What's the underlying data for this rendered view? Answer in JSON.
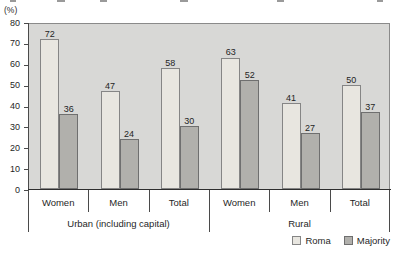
{
  "chart_data": {
    "type": "bar",
    "title": "",
    "ylabel": "(%)",
    "xlabel": "",
    "categories": [
      "Women",
      "Men",
      "Total",
      "Women",
      "Men",
      "Total"
    ],
    "groups": [
      {
        "label": "Urban (including capital)",
        "start": 0,
        "end": 2
      },
      {
        "label": "Rural",
        "start": 3,
        "end": 5
      }
    ],
    "series": [
      {
        "name": "Roma",
        "color": "#e8e6e0",
        "border_color": "#858585",
        "values": [
          72,
          47,
          58,
          63,
          41,
          50
        ]
      },
      {
        "name": "Majority",
        "color": "#b1b0ac",
        "border_color": "#6f6f6f",
        "values": [
          36,
          24,
          30,
          52,
          27,
          37
        ]
      }
    ],
    "ylim": [
      0,
      80
    ],
    "yticks": [
      0,
      10,
      20,
      30,
      40,
      50,
      60,
      70,
      80
    ],
    "grid": false,
    "plot_background": "#d8d8d6",
    "legend_position": "bottom-right"
  }
}
